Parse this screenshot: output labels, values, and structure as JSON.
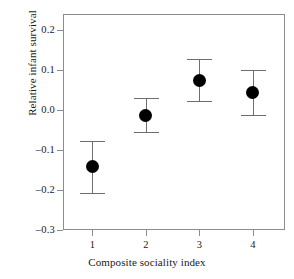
{
  "chart_data": {
    "type": "scatter",
    "title": "",
    "xlabel": "Composite sociality index",
    "ylabel": "Relative infant survival",
    "categories": [
      "1",
      "2",
      "3",
      "4"
    ],
    "x": [
      1,
      2,
      3,
      4
    ],
    "values": [
      -0.14,
      -0.013,
      0.075,
      0.045
    ],
    "error_low": [
      -0.208,
      -0.056,
      0.022,
      -0.012
    ],
    "error_high": [
      -0.078,
      0.03,
      0.128,
      0.099
    ],
    "ylim": [
      -0.3,
      0.24
    ],
    "xlim": [
      0.45,
      4.6
    ],
    "yticks": [
      0.2,
      0.1,
      0.0,
      -0.1,
      -0.2,
      -0.3
    ],
    "ytick_labels": [
      "0.2",
      "0.1",
      "0.0",
      "–0.1",
      "–0.2",
      "–0.3"
    ],
    "xticks": [
      1,
      2,
      3,
      4
    ],
    "xtick_labels": [
      "1",
      "2",
      "3",
      "4"
    ],
    "grid": false,
    "legend": null,
    "marker_color": "#000000",
    "errorbar_color": "#6e6e6e",
    "frame_color": "#8c8c8c",
    "background": "#ffffff"
  }
}
